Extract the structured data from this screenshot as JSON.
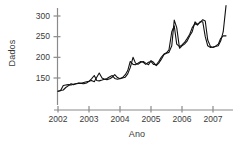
{
  "chart_data": {
    "type": "line",
    "title": "",
    "xlabel": "Ano",
    "ylabel": "Dados",
    "xlim": [
      2002.0,
      2007.6
    ],
    "ylim": [
      110,
      330
    ],
    "xticks": [
      2002,
      2003,
      2004,
      2005,
      2006,
      2007
    ],
    "xticklabels": [
      "2002",
      "2003",
      "2004",
      "2005",
      "2006",
      "2007"
    ],
    "yticks": [
      150,
      200,
      250,
      300
    ],
    "yticklabels": [
      "150",
      "200",
      "250",
      "300"
    ],
    "grid": false,
    "legend": "none",
    "axis_color": "#8a8a8a",
    "line_color": "#111111",
    "series": [
      {
        "name": "observado",
        "x": [
          2002.0,
          2002.08,
          2002.17,
          2002.25,
          2002.33,
          2002.42,
          2002.5,
          2002.58,
          2002.67,
          2002.75,
          2002.83,
          2002.92,
          2003.0,
          2003.08,
          2003.17,
          2003.25,
          2003.33,
          2003.42,
          2003.5,
          2003.58,
          2003.67,
          2003.75,
          2003.83,
          2003.92,
          2004.0,
          2004.08,
          2004.17,
          2004.25,
          2004.33,
          2004.42,
          2004.5,
          2004.58,
          2004.67,
          2004.75,
          2004.83,
          2004.92,
          2005.0,
          2005.08,
          2005.17,
          2005.25,
          2005.33,
          2005.42,
          2005.5,
          2005.58,
          2005.67,
          2005.75,
          2005.83,
          2005.92,
          2006.0,
          2006.08,
          2006.17,
          2006.25,
          2006.33,
          2006.42,
          2006.5,
          2006.58,
          2006.67,
          2006.75,
          2006.83,
          2006.92,
          2007.0,
          2007.08,
          2007.17,
          2007.25,
          2007.33,
          2007.42
        ],
        "values": [
          118,
          120,
          121,
          127,
          131,
          136,
          134,
          136,
          138,
          137,
          136,
          138,
          142,
          144,
          141,
          152,
          162,
          150,
          147,
          146,
          148,
          152,
          158,
          151,
          148,
          150,
          152,
          160,
          175,
          200,
          186,
          183,
          188,
          190,
          186,
          182,
          192,
          188,
          180,
          186,
          195,
          207,
          210,
          212,
          228,
          290,
          272,
          222,
          228,
          232,
          240,
          252,
          262,
          286,
          280,
          284,
          291,
          288,
          242,
          226,
          224,
          226,
          228,
          240,
          262,
          325
        ]
      },
      {
        "name": "ajustado",
        "x": [
          2002.0,
          2002.08,
          2002.17,
          2002.25,
          2002.33,
          2002.42,
          2002.5,
          2002.58,
          2002.67,
          2002.75,
          2002.83,
          2002.92,
          2003.0,
          2003.08,
          2003.17,
          2003.25,
          2003.33,
          2003.42,
          2003.5,
          2003.58,
          2003.67,
          2003.75,
          2003.83,
          2003.92,
          2004.0,
          2004.08,
          2004.17,
          2004.25,
          2004.33,
          2004.42,
          2004.5,
          2004.58,
          2004.67,
          2004.75,
          2004.83,
          2004.92,
          2005.0,
          2005.08,
          2005.17,
          2005.25,
          2005.33,
          2005.42,
          2005.5,
          2005.58,
          2005.67,
          2005.75,
          2005.83,
          2005.92,
          2006.0,
          2006.08,
          2006.17,
          2006.25,
          2006.33,
          2006.42,
          2006.5,
          2006.58,
          2006.67,
          2006.75,
          2006.83,
          2006.92,
          2007.0,
          2007.08,
          2007.17,
          2007.25,
          2007.33,
          2007.42
        ],
        "values": [
          118,
          119,
          132,
          133,
          134,
          133,
          135,
          136,
          137,
          137,
          139,
          141,
          142,
          148,
          156,
          144,
          143,
          145,
          147,
          149,
          153,
          156,
          149,
          147,
          149,
          151,
          158,
          168,
          190,
          183,
          182,
          186,
          190,
          188,
          183,
          188,
          190,
          183,
          182,
          190,
          200,
          208,
          211,
          218,
          262,
          276,
          232,
          226,
          230,
          236,
          246,
          256,
          272,
          282,
          278,
          286,
          286,
          250,
          228,
          224,
          225,
          227,
          232,
          246,
          252,
          252
        ]
      }
    ]
  }
}
